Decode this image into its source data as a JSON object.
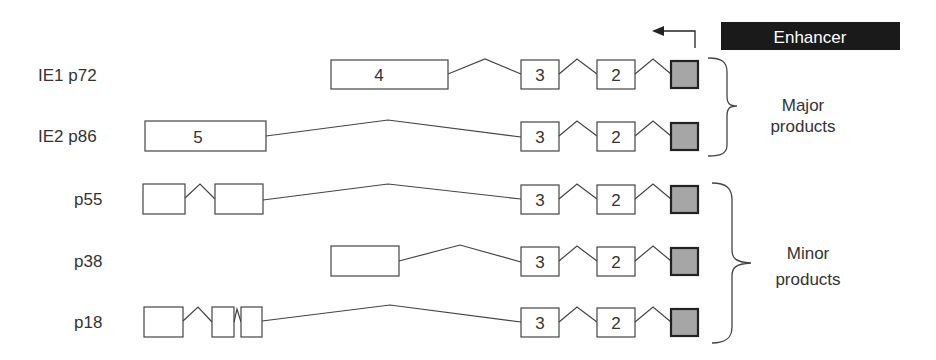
{
  "enhancer": {
    "label": "Enhancer",
    "fill": "#1a1a1a",
    "text_color": "#ffffff"
  },
  "transcription_arrow": {
    "direction": "left"
  },
  "transcripts": [
    {
      "name": "IE1 p72",
      "exons": [
        "4",
        "3",
        "2",
        ""
      ]
    },
    {
      "name": "IE2 p86",
      "exons": [
        "5",
        "3",
        "2",
        ""
      ]
    },
    {
      "name": "p55",
      "exons": [
        "",
        "",
        "3",
        "2",
        ""
      ]
    },
    {
      "name": "p38",
      "exons": [
        "",
        "3",
        "2",
        ""
      ]
    },
    {
      "name": "p18",
      "exons": [
        "",
        "",
        "",
        "3",
        "2",
        ""
      ]
    }
  ],
  "groups": {
    "major": {
      "line1": "Major",
      "line2": "products"
    },
    "minor": {
      "line1": "Minor",
      "line2": "products"
    }
  },
  "colors": {
    "exon1_fill": "#a6a6a6",
    "stroke": "#444444"
  }
}
